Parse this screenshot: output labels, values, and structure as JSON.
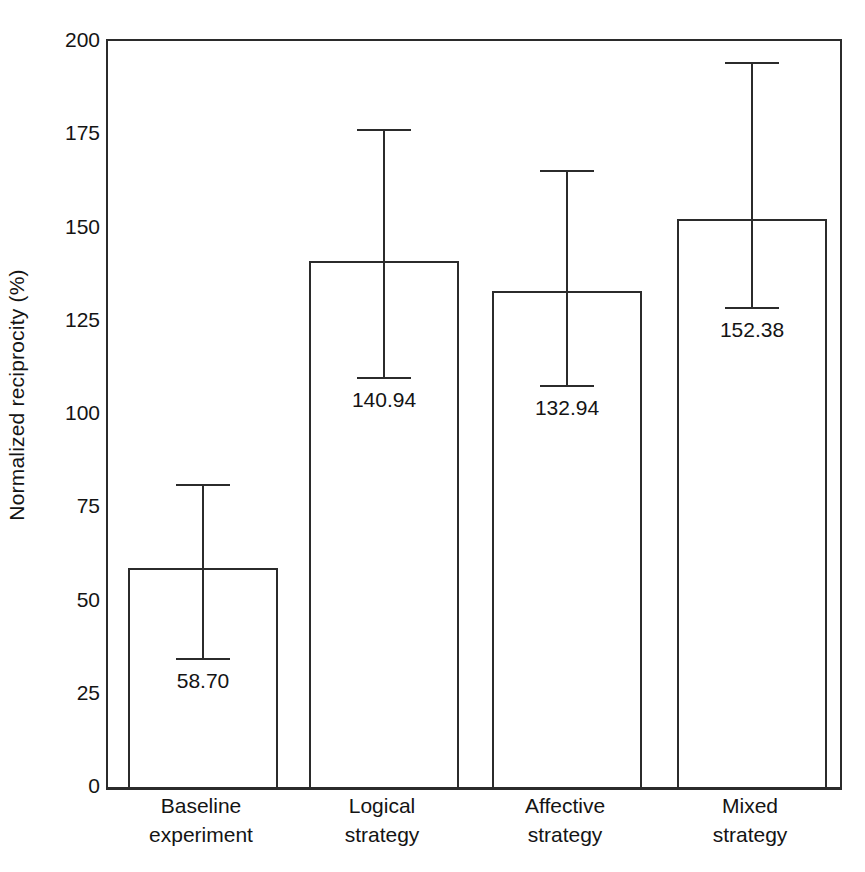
{
  "chart_data": {
    "type": "bar",
    "title": "",
    "xlabel": "",
    "ylabel": "Normalized reciprocity (%)",
    "ylim": [
      0,
      200
    ],
    "yticks": [
      0,
      25,
      50,
      75,
      100,
      125,
      150,
      175,
      200
    ],
    "ytick_labels": [
      "0",
      "25",
      "50",
      "75",
      "100",
      "125",
      "150",
      "175",
      "200"
    ],
    "grid": false,
    "legend": false,
    "categories": [
      "Baseline experiment",
      "Logical strategy",
      "Affective strategy",
      "Mixed strategy"
    ],
    "category_lines": [
      [
        "Baseline",
        "experiment"
      ],
      [
        "Logical",
        "strategy"
      ],
      [
        "Affective",
        "strategy"
      ],
      [
        "Mixed",
        "strategy"
      ]
    ],
    "values": [
      58.7,
      140.94,
      132.94,
      152.38
    ],
    "value_labels": [
      "58.70",
      "140.94",
      "132.94",
      "152.38"
    ],
    "error_upper": [
      81.2,
      176.4,
      165.4,
      194.4
    ],
    "error_lower": [
      34.0,
      109.4,
      107.2,
      128.2
    ],
    "bar_face_color": "#ffffff",
    "bar_edge_color": "#2b2b2b",
    "errorbar_color": "#2b2b2b",
    "axis_color": "#2b2b2b",
    "text_color": "#141414",
    "background_color": "#ffffff"
  },
  "axis": {
    "y_title": "Normalized reciprocity (%)"
  }
}
